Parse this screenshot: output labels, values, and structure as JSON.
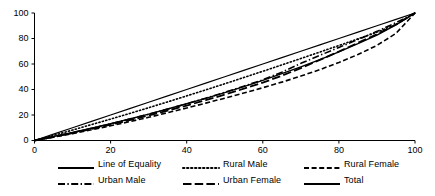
{
  "chart_data": {
    "type": "line",
    "title": "",
    "subtitle": "",
    "xlabel": "",
    "ylabel": "",
    "xlim": [
      0,
      100
    ],
    "ylim": [
      0,
      100
    ],
    "grid": false,
    "legend_position": "bottom",
    "x_ticks": [
      "0",
      "20",
      "40",
      "60",
      "80",
      "100"
    ],
    "y_ticks": [
      "0",
      "20",
      "40",
      "60",
      "80",
      "100"
    ],
    "x": [
      0,
      5,
      10,
      15,
      20,
      25,
      30,
      35,
      40,
      45,
      50,
      55,
      60,
      65,
      70,
      75,
      80,
      85,
      90,
      95,
      100
    ],
    "series": [
      {
        "name": "Line of Equality",
        "style": "solid",
        "color": "#000000",
        "width": 1.1,
        "values": [
          0,
          5,
          10,
          15,
          20,
          25,
          30,
          35,
          40,
          45,
          50,
          55,
          60,
          65,
          70,
          75,
          80,
          85,
          90,
          95,
          100
        ]
      },
      {
        "name": "Rural Male",
        "style": "dotted",
        "color": "#000000",
        "width": 1.6,
        "values": [
          0,
          4.0,
          8.2,
          12.5,
          16.8,
          21.2,
          25.7,
          30.3,
          35.0,
          39.7,
          44.5,
          49.4,
          54.3,
          59.3,
          64.3,
          69.4,
          74.5,
          79.7,
          85.0,
          91.0,
          100
        ]
      },
      {
        "name": "Rural Female",
        "style": "dashed",
        "color": "#000000",
        "width": 1.6,
        "values": [
          0,
          2.6,
          5.4,
          8.4,
          11.5,
          14.8,
          18.2,
          21.8,
          25.5,
          29.3,
          33.2,
          37.2,
          41.4,
          45.8,
          50.5,
          55.6,
          61.2,
          67.4,
          74.6,
          84.0,
          100
        ]
      },
      {
        "name": "Urban Male",
        "style": "dashdot",
        "color": "#000000",
        "width": 1.6,
        "values": [
          0,
          3.0,
          6.2,
          9.6,
          13.1,
          16.8,
          20.6,
          24.6,
          28.8,
          33.2,
          37.8,
          42.6,
          47.6,
          53.6,
          60.5,
          66.8,
          73.0,
          79.2,
          85.6,
          92.4,
          100
        ]
      },
      {
        "name": "Urban Female",
        "style": "longdash",
        "color": "#000000",
        "width": 1.8,
        "values": [
          0,
          2.8,
          5.8,
          9.0,
          12.4,
          15.9,
          19.6,
          23.4,
          27.4,
          31.6,
          36.0,
          40.6,
          45.4,
          50.8,
          56.8,
          63.2,
          69.8,
          76.6,
          83.4,
          91.0,
          100
        ]
      },
      {
        "name": "Total",
        "style": "solid",
        "color": "#000000",
        "width": 1.4,
        "values": [
          0,
          3.1,
          6.3,
          9.7,
          13.2,
          16.9,
          20.7,
          24.7,
          28.8,
          33.1,
          37.6,
          42.3,
          47.2,
          52.4,
          57.8,
          63.5,
          69.5,
          75.9,
          82.7,
          90.6,
          100
        ]
      }
    ],
    "legend": [
      {
        "label": "Line of Equality",
        "style": "solid"
      },
      {
        "label": "Rural Male",
        "style": "dotted"
      },
      {
        "label": "Rural Female",
        "style": "dashed"
      },
      {
        "label": "Urban Male",
        "style": "dashdot"
      },
      {
        "label": "Urban Female",
        "style": "longdash"
      },
      {
        "label": "Total",
        "style": "solid"
      }
    ]
  }
}
